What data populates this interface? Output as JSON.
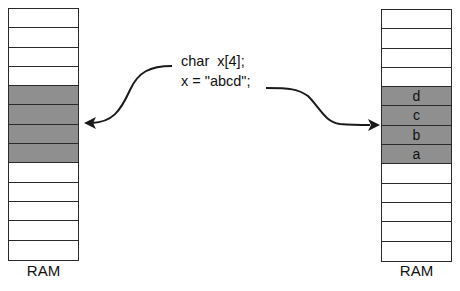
{
  "code": {
    "line1": "char  x[4];",
    "line2": "x = \"abcd\";"
  },
  "ram_left": {
    "label": "RAM",
    "cells": [
      "",
      "",
      "",
      "",
      "",
      "",
      "",
      "",
      "",
      "",
      "",
      "",
      ""
    ],
    "shaded": [
      false,
      false,
      false,
      false,
      true,
      true,
      true,
      true,
      false,
      false,
      false,
      false,
      false
    ]
  },
  "ram_right": {
    "label": "RAM",
    "cells": [
      "",
      "",
      "",
      "",
      "d",
      "c",
      "b",
      "a",
      "",
      "",
      "",
      "",
      ""
    ],
    "shaded": [
      false,
      false,
      false,
      false,
      true,
      true,
      true,
      true,
      false,
      false,
      false,
      false,
      false
    ]
  },
  "colors": {
    "shaded_cell": "#8f8f8f",
    "line": "#1a1a1a"
  }
}
